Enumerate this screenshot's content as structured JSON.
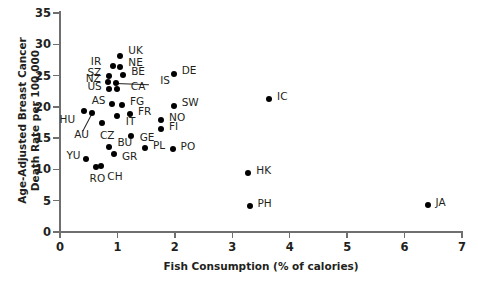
{
  "chart_data": {
    "type": "scatter",
    "title": "",
    "xlabel": "Fish Consumption (% of calories)",
    "ylabel_line1": "Age-Adjusted Breast Cancer",
    "ylabel_line2": "Death Rate per 100,000",
    "xlim": [
      0,
      7
    ],
    "ylim": [
      0,
      35
    ],
    "xticks": [
      0,
      1,
      2,
      3,
      4,
      5,
      6,
      7
    ],
    "yticks": [
      0,
      5,
      10,
      15,
      20,
      25,
      30,
      35
    ],
    "grid": false,
    "legend": "none",
    "marker": "filled-circle",
    "marker_color": "#000000",
    "points": [
      {
        "label": "UK",
        "x": 1.05,
        "y": 28.2,
        "lx": 8,
        "ly": -11
      },
      {
        "label": "IR",
        "x": 0.92,
        "y": 26.5,
        "lx": -22,
        "ly": -10
      },
      {
        "label": "NE",
        "x": 1.05,
        "y": 26.3,
        "lx": 8,
        "ly": -10
      },
      {
        "label": "BE",
        "x": 1.1,
        "y": 25.1,
        "lx": 8,
        "ly": -9
      },
      {
        "label": "SZ",
        "x": 0.86,
        "y": 24.9,
        "lx": -22,
        "ly": -9
      },
      {
        "label": "DE",
        "x": 1.98,
        "y": 25.2,
        "lx": 8,
        "ly": -9
      },
      {
        "label": "NZ",
        "x": 0.83,
        "y": 23.9,
        "lx": -22,
        "ly": -9
      },
      {
        "label": "IS",
        "x": 0.98,
        "y": 23.8,
        "lx": 44,
        "ly": -8
      },
      {
        "label": "CA",
        "x": 0.99,
        "y": 22.9,
        "lx": 14,
        "ly": -8
      },
      {
        "label": "US",
        "x": 0.86,
        "y": 22.8,
        "lx": -22,
        "ly": -8
      },
      {
        "label": "AS",
        "x": 0.9,
        "y": 20.4,
        "lx": -20,
        "ly": -9
      },
      {
        "label": "FG",
        "x": 1.08,
        "y": 20.3,
        "lx": 8,
        "ly": -9
      },
      {
        "label": "SW",
        "x": 1.98,
        "y": 20.2,
        "lx": 8,
        "ly": -9
      },
      {
        "label": "HU",
        "x": 0.41,
        "y": 19.4,
        "lx": -24,
        "ly": 3
      },
      {
        "label": "FR",
        "x": 1.22,
        "y": 18.8,
        "lx": 8,
        "ly": -8
      },
      {
        "label": "AU",
        "x": 0.56,
        "y": 19.0,
        "lx": -18,
        "ly": 16
      },
      {
        "label": "IT",
        "x": 0.99,
        "y": 18.6,
        "lx": 9,
        "ly": 0
      },
      {
        "label": "NO",
        "x": 1.76,
        "y": 17.9,
        "lx": 8,
        "ly": -8
      },
      {
        "label": "CZ",
        "x": 0.73,
        "y": 17.5,
        "lx": -2,
        "ly": 7
      },
      {
        "label": "FI",
        "x": 1.76,
        "y": 16.4,
        "lx": 8,
        "ly": -8
      },
      {
        "label": "GE",
        "x": 1.23,
        "y": 15.3,
        "lx": 9,
        "ly": -4
      },
      {
        "label": "BU",
        "x": 0.86,
        "y": 13.6,
        "lx": 8,
        "ly": -10
      },
      {
        "label": "PL",
        "x": 1.48,
        "y": 13.5,
        "lx": 8,
        "ly": -8
      },
      {
        "label": "PO",
        "x": 1.96,
        "y": 13.3,
        "lx": 8,
        "ly": -8
      },
      {
        "label": "GR",
        "x": 0.94,
        "y": 12.5,
        "lx": 8,
        "ly": -3
      },
      {
        "label": "YU",
        "x": 0.46,
        "y": 11.7,
        "lx": -20,
        "ly": -9
      },
      {
        "label": "RO",
        "x": 0.62,
        "y": 10.4,
        "lx": -6,
        "ly": 6
      },
      {
        "label": "CH",
        "x": 0.72,
        "y": 10.5,
        "lx": 6,
        "ly": 5
      },
      {
        "label": "HK",
        "x": 3.28,
        "y": 9.4,
        "lx": 8,
        "ly": -8
      },
      {
        "label": "PH",
        "x": 3.3,
        "y": 4.2,
        "lx": 8,
        "ly": -8
      },
      {
        "label": "IC",
        "x": 3.64,
        "y": 21.3,
        "lx": 8,
        "ly": -8
      },
      {
        "label": "JA",
        "x": 6.4,
        "y": 4.3,
        "lx": 8,
        "ly": -8
      }
    ],
    "leader_lines": [
      {
        "from_label": "IS",
        "x1": 0.98,
        "y1": 23.8,
        "x2": 1.55,
        "y2": 23.6
      },
      {
        "from_label": "AU",
        "x1": 0.56,
        "y1": 19.0,
        "x2": 0.4,
        "y2": 16.2
      }
    ]
  }
}
